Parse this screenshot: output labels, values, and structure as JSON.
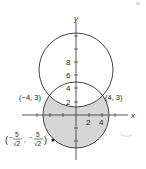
{
  "figure": {
    "axes": {
      "x_label": "x",
      "y_label": "y"
    },
    "x_ticks": [
      {
        "value": 2,
        "label": "2"
      },
      {
        "value": 4,
        "label": "4"
      }
    ],
    "y_ticks": [
      {
        "value": 2,
        "label": "2"
      },
      {
        "value": 4,
        "label": "4"
      },
      {
        "value": 6,
        "label": "6"
      },
      {
        "value": 8,
        "label": "8"
      }
    ],
    "points": [
      {
        "label": "(−4, 3)"
      },
      {
        "label": "(4, 3)"
      },
      {
        "label_num": "5",
        "label_den": "√2",
        "description": "(−5/√2, −5/√2)"
      }
    ],
    "regions": {
      "lower_circle": "x² + y² = 25 (shaded outside upper circle)",
      "upper_circle": "x² + (y − 6)² = 25"
    },
    "colors": {
      "shade": "#d6d6d6",
      "stroke": "#444444",
      "text": "#222222"
    }
  }
}
